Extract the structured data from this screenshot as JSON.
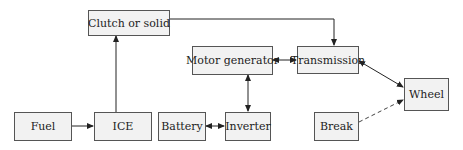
{
  "diagram": {
    "nodes": {
      "clutch": "Clutch or solid",
      "motor_generator": "Motor generator",
      "transmission": "Transmission",
      "wheel": "Wheel",
      "fuel": "Fuel",
      "ice": "ICE",
      "battery": "Battery",
      "inverter": "Inverter",
      "break": "Break"
    },
    "edges": [
      {
        "from": "Fuel",
        "to": "ICE",
        "style": "solid",
        "direction": "forward"
      },
      {
        "from": "ICE",
        "to": "Clutch or solid",
        "style": "solid",
        "direction": "forward"
      },
      {
        "from": "Clutch or solid",
        "to": "Transmission",
        "style": "solid",
        "direction": "forward"
      },
      {
        "from": "Motor generator",
        "to": "Transmission",
        "style": "solid",
        "direction": "both"
      },
      {
        "from": "Motor generator",
        "to": "Inverter",
        "style": "solid",
        "direction": "both"
      },
      {
        "from": "Battery",
        "to": "Inverter",
        "style": "solid",
        "direction": "both"
      },
      {
        "from": "Transmission",
        "to": "Wheel",
        "style": "solid",
        "direction": "both"
      },
      {
        "from": "Break",
        "to": "Wheel",
        "style": "dashed",
        "direction": "forward"
      }
    ],
    "colors": {
      "box_fill": "#f2f2f2",
      "box_border": "#555555",
      "line": "#222222"
    }
  }
}
